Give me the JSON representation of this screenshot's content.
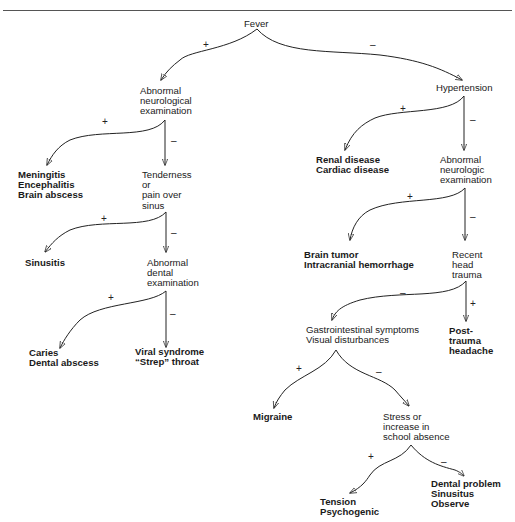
{
  "diagram": {
    "type": "decision-tree",
    "nodes": {
      "fever": {
        "lines": [
          "Fever"
        ]
      },
      "abn_neuro": {
        "lines": [
          "Abnormal",
          "neurological",
          "examination"
        ]
      },
      "meningitis": {
        "lines": [
          "Meningitis",
          "Encephalitis",
          "Brain abscess"
        ],
        "outcome": true
      },
      "tenderness": {
        "lines": [
          "Tenderness",
          "or",
          "pain over",
          "sinus"
        ]
      },
      "sinusitis": {
        "lines": [
          "Sinusitis"
        ],
        "outcome": true
      },
      "abn_dental": {
        "lines": [
          "Abnormal",
          "dental",
          "examination"
        ]
      },
      "caries": {
        "lines": [
          "Caries",
          "Dental abscess"
        ],
        "outcome": true
      },
      "viral": {
        "lines": [
          "Viral syndrome",
          "“Strep” throat"
        ],
        "outcome": true
      },
      "hypertension": {
        "lines": [
          "Hypertension"
        ]
      },
      "renal": {
        "lines": [
          "Renal disease",
          "Cardiac disease"
        ],
        "outcome": true
      },
      "abn_neurologic": {
        "lines": [
          "Abnormal",
          "neurologic",
          "examination"
        ]
      },
      "brain_tumor": {
        "lines": [
          "Brain tumor",
          "Intracranial hemorrhage"
        ],
        "outcome": true
      },
      "head_trauma": {
        "lines": [
          "Recent",
          "head",
          "trauma"
        ]
      },
      "post_trauma": {
        "lines": [
          "Post-",
          "trauma",
          "headache"
        ],
        "outcome": true
      },
      "gi": {
        "lines": [
          "Gastrointestinal symptoms",
          "Visual disturbances"
        ]
      },
      "migraine": {
        "lines": [
          "Migraine"
        ],
        "outcome": true
      },
      "stress": {
        "lines": [
          "Stress or",
          "increase in",
          "school absence"
        ]
      },
      "tension": {
        "lines": [
          "Tension",
          "Psychogenic"
        ],
        "outcome": true
      },
      "dental_problem": {
        "lines": [
          "Dental problem",
          "Sinusitus",
          "Observe"
        ],
        "outcome": true
      }
    },
    "edges": [
      {
        "from": "fever",
        "to": "abn_neuro",
        "sign": "+"
      },
      {
        "from": "fever",
        "to": "hypertension",
        "sign": "–"
      },
      {
        "from": "abn_neuro",
        "to": "meningitis",
        "sign": "+"
      },
      {
        "from": "abn_neuro",
        "to": "tenderness",
        "sign": "–"
      },
      {
        "from": "tenderness",
        "to": "sinusitis",
        "sign": "+"
      },
      {
        "from": "tenderness",
        "to": "abn_dental",
        "sign": "–"
      },
      {
        "from": "abn_dental",
        "to": "caries",
        "sign": "+"
      },
      {
        "from": "abn_dental",
        "to": "viral",
        "sign": "–"
      },
      {
        "from": "hypertension",
        "to": "renal",
        "sign": "+"
      },
      {
        "from": "hypertension",
        "to": "abn_neurologic",
        "sign": "–"
      },
      {
        "from": "abn_neurologic",
        "to": "brain_tumor",
        "sign": "+"
      },
      {
        "from": "abn_neurologic",
        "to": "head_trauma",
        "sign": "–"
      },
      {
        "from": "head_trauma",
        "to": "gi",
        "sign": "–"
      },
      {
        "from": "head_trauma",
        "to": "post_trauma",
        "sign": "+"
      },
      {
        "from": "gi",
        "to": "migraine",
        "sign": "+"
      },
      {
        "from": "gi",
        "to": "stress",
        "sign": "–"
      },
      {
        "from": "stress",
        "to": "tension",
        "sign": "+"
      },
      {
        "from": "stress",
        "to": "dental_problem",
        "sign": "–"
      }
    ]
  },
  "signs": {
    "plus": "+",
    "minus": "–"
  },
  "colors": {
    "line": "#222222",
    "text": "#1a1a1a",
    "background": "#ffffff"
  }
}
